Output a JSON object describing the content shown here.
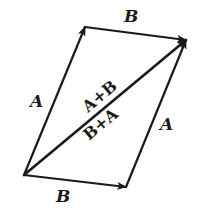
{
  "diagram": {
    "colors": {
      "line": "#1a1a1a",
      "background": "#ffffff"
    },
    "points": {
      "origin": [
        24,
        175
      ],
      "a_tip": [
        85,
        27
      ],
      "sum_tip": [
        186,
        40
      ],
      "b_tip": [
        126,
        187
      ]
    },
    "vectors": [
      {
        "name": "A",
        "from": "origin",
        "to": "a_tip"
      },
      {
        "name": "B",
        "from": "a_tip",
        "to": "sum_tip"
      },
      {
        "name": "B",
        "from": "origin",
        "to": "b_tip"
      },
      {
        "name": "A",
        "from": "b_tip",
        "to": "sum_tip"
      },
      {
        "name": "A+B",
        "from": "origin",
        "to": "sum_tip"
      }
    ],
    "labels": {
      "top_b": "B",
      "left_a": "A",
      "right_a": "A",
      "bottom_b": "B",
      "sum_upper": "A+B",
      "sum_lower": "B+A"
    }
  }
}
